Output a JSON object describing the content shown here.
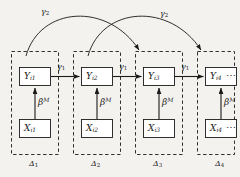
{
  "figure": {
    "type": "graphical-model-diagram",
    "background_color": "#f4f2ef",
    "line_color": "#1a1a1a",
    "node_fill": "#ffffff"
  },
  "plates": [
    {
      "id": "plate1",
      "label": "Δ",
      "subscript": "1"
    },
    {
      "id": "plate2",
      "label": "Δ",
      "subscript": "2"
    },
    {
      "id": "plate3",
      "label": "Δ",
      "subscript": "3"
    },
    {
      "id": "plate4",
      "label": "Δ",
      "subscript": "4"
    }
  ],
  "nodes": {
    "y": [
      {
        "id": "Y1",
        "label": "Y",
        "subscript": "i1"
      },
      {
        "id": "Y2",
        "label": "Y",
        "subscript": "i2"
      },
      {
        "id": "Y3",
        "label": "Y",
        "subscript": "i3"
      },
      {
        "id": "Y4",
        "label": "Y",
        "subscript": "i4"
      }
    ],
    "x": [
      {
        "id": "X1",
        "label": "X",
        "subscript": "i1"
      },
      {
        "id": "X2",
        "label": "X",
        "subscript": "i2"
      },
      {
        "id": "X3",
        "label": "X",
        "subscript": "i3"
      },
      {
        "id": "X4",
        "label": "X",
        "subscript": "i4"
      }
    ]
  },
  "edges": {
    "lag1": [
      {
        "from": "Y1",
        "to": "Y2",
        "label": "γ",
        "subscript": "1"
      },
      {
        "from": "Y2",
        "to": "Y3",
        "label": "γ",
        "subscript": "1"
      },
      {
        "from": "Y3",
        "to": "Y4",
        "label": "γ",
        "subscript": "1"
      }
    ],
    "lag2": [
      {
        "from": "Y1",
        "to": "Y3",
        "label": "γ",
        "subscript": "2"
      },
      {
        "from": "Y2",
        "to": "Y4",
        "label": "γ",
        "subscript": "2"
      }
    ],
    "measurement": [
      {
        "from": "X1",
        "to": "Y1",
        "label": "β",
        "superscript": "M"
      },
      {
        "from": "X2",
        "to": "Y2",
        "label": "β",
        "superscript": "M"
      },
      {
        "from": "X3",
        "to": "Y3",
        "label": "β",
        "superscript": "M"
      },
      {
        "from": "X4",
        "to": "Y4",
        "label": "β",
        "superscript": "M"
      }
    ]
  },
  "continuation": {
    "y_row": "⋯",
    "x_row": "⋯"
  }
}
